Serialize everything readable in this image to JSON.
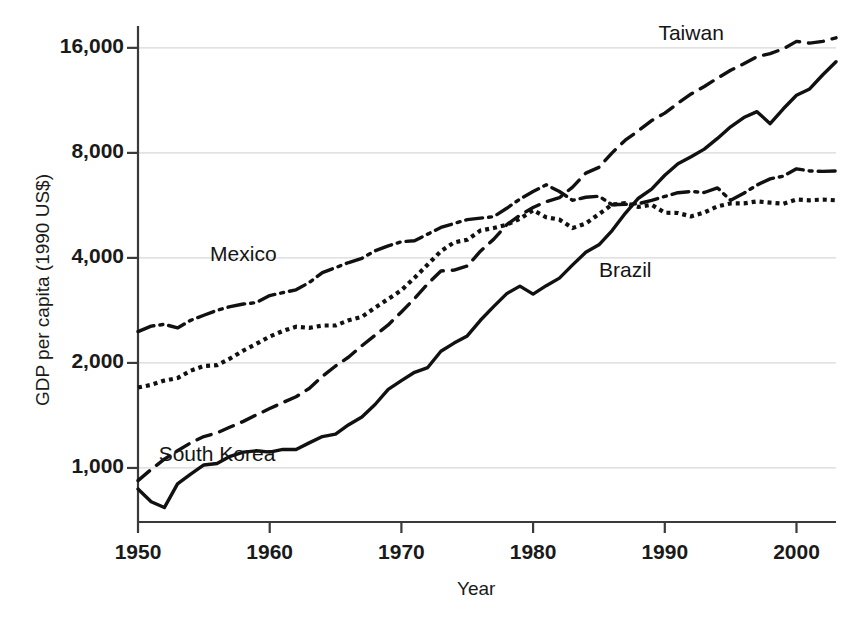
{
  "chart_data": {
    "type": "line",
    "title": "",
    "xlabel": "Year",
    "ylabel": "GDP per capita (1990 US$)",
    "yscale": "log",
    "ylim": [
      700,
      18000
    ],
    "xlim": [
      1950,
      2003
    ],
    "grid": true,
    "gridlines_y": [
      1000,
      2000,
      4000,
      8000,
      16000
    ],
    "ytick_labels": [
      "1,000",
      "2,000",
      "4,000",
      "8,000",
      "16,000"
    ],
    "ytick_values": [
      1000,
      2000,
      4000,
      8000,
      16000
    ],
    "xtick_labels": [
      "1950",
      "1960",
      "1970",
      "1980",
      "1990",
      "2000"
    ],
    "xtick_values": [
      1950,
      1960,
      1970,
      1980,
      1990,
      2000
    ],
    "legend_position": "inline-annotations",
    "x": [
      1950,
      1951,
      1952,
      1953,
      1954,
      1955,
      1956,
      1957,
      1958,
      1959,
      1960,
      1961,
      1962,
      1963,
      1964,
      1965,
      1966,
      1967,
      1968,
      1969,
      1970,
      1971,
      1972,
      1973,
      1974,
      1975,
      1976,
      1977,
      1978,
      1979,
      1980,
      1981,
      1982,
      1983,
      1984,
      1985,
      1986,
      1987,
      1988,
      1989,
      1990,
      1991,
      1992,
      1993,
      1994,
      1995,
      1996,
      1997,
      1998,
      1999,
      2000,
      2001,
      2002,
      2003
    ],
    "series": [
      {
        "name": "South Korea",
        "style": "solid",
        "label_x": 1956,
        "label_y": 1080,
        "values": [
          870,
          800,
          770,
          900,
          960,
          1020,
          1030,
          1080,
          1110,
          1120,
          1110,
          1130,
          1130,
          1180,
          1230,
          1250,
          1330,
          1400,
          1520,
          1680,
          1780,
          1880,
          1940,
          2160,
          2280,
          2390,
          2650,
          2900,
          3160,
          3320,
          3150,
          3330,
          3500,
          3820,
          4150,
          4360,
          4790,
          5370,
          5930,
          6300,
          6900,
          7450,
          7800,
          8200,
          8800,
          9500,
          10100,
          10500,
          9700,
          10700,
          11700,
          12200,
          13400,
          14600
        ]
      },
      {
        "name": "Taiwan",
        "style": "dashed",
        "label_x": 1992,
        "label_y": 17400,
        "values": [
          920,
          990,
          1060,
          1120,
          1180,
          1230,
          1260,
          1310,
          1360,
          1420,
          1480,
          1540,
          1600,
          1690,
          1830,
          1960,
          2080,
          2240,
          2400,
          2570,
          2800,
          3060,
          3370,
          3670,
          3690,
          3790,
          4180,
          4520,
          4980,
          5300,
          5580,
          5800,
          5950,
          6380,
          7000,
          7270,
          8000,
          8700,
          9260,
          9900,
          10400,
          11100,
          11800,
          12400,
          13100,
          13800,
          14400,
          15100,
          15400,
          15900,
          16700,
          16500,
          16700,
          17100
        ]
      },
      {
        "name": "Mexico",
        "style": "dashdot",
        "label_x": 1958,
        "label_y": 4050,
        "values": [
          2460,
          2550,
          2580,
          2520,
          2650,
          2740,
          2830,
          2900,
          2950,
          2980,
          3120,
          3180,
          3240,
          3400,
          3630,
          3750,
          3880,
          3990,
          4190,
          4330,
          4450,
          4480,
          4680,
          4890,
          5020,
          5150,
          5200,
          5250,
          5550,
          5900,
          6200,
          6480,
          6200,
          5850,
          5970,
          6010,
          5680,
          5700,
          5720,
          5850,
          6000,
          6150,
          6200,
          6160,
          6350,
          5850,
          6130,
          6470,
          6740,
          6860,
          7200,
          7100,
          7080,
          7100
        ]
      },
      {
        "name": "Brazil",
        "style": "dotted",
        "label_x": 1987,
        "label_y": 3650,
        "values": [
          1700,
          1730,
          1780,
          1810,
          1900,
          1960,
          1970,
          2060,
          2170,
          2270,
          2380,
          2470,
          2540,
          2520,
          2560,
          2560,
          2650,
          2710,
          2880,
          3050,
          3230,
          3510,
          3830,
          4180,
          4430,
          4510,
          4790,
          4870,
          4980,
          5180,
          5480,
          5230,
          5150,
          4870,
          5020,
          5340,
          5690,
          5740,
          5600,
          5680,
          5390,
          5380,
          5260,
          5400,
          5620,
          5730,
          5730,
          5810,
          5760,
          5720,
          5880,
          5850,
          5880,
          5850
        ]
      }
    ]
  },
  "axes": {
    "ylabel": "GDP per capita (1990 US$)",
    "xlabel": "Year"
  },
  "ytick_labels": {
    "t0": "1,000",
    "t1": "2,000",
    "t2": "4,000",
    "t3": "8,000",
    "t4": "16,000"
  },
  "xtick_labels": {
    "t0": "1950",
    "t1": "1960",
    "t2": "1970",
    "t3": "1980",
    "t4": "1990",
    "t5": "2000"
  },
  "series_labels": {
    "taiwan": "Taiwan",
    "mexico": "Mexico",
    "brazil": "Brazil",
    "south_korea": "South Korea"
  },
  "colors": {
    "line": "#111111",
    "grid": "#d8d8d8",
    "axis": "#3a3a3a",
    "background": "#ffffff"
  }
}
